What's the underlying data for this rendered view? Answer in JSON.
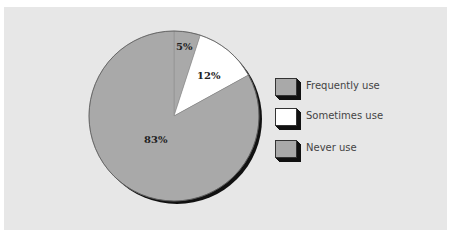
{
  "chart_data": {
    "type": "pie",
    "title": "",
    "slices": [
      {
        "label": "Frequently use",
        "value": 5,
        "display": "5%",
        "color": "#a9a9a9"
      },
      {
        "label": "Sometimes use",
        "value": 12,
        "display": "12%",
        "color": "#ffffff"
      },
      {
        "label": "Never use",
        "value": 83,
        "display": "83%",
        "color": "#a9a9a9"
      }
    ],
    "categories": [
      "Frequently use",
      "Sometimes use",
      "Never use"
    ],
    "values": [
      5,
      12,
      83
    ],
    "unit": "%",
    "legend_position": "right",
    "start_angle": "12 o'clock, clockwise",
    "style": "3D drop shadow"
  },
  "colors": {
    "panel_background": "#e7e7e7",
    "page_background": "#ffffff",
    "slice_gray": "#a9a9a9",
    "slice_white": "#ffffff",
    "shadow": "#111111"
  },
  "legend": {
    "items": [
      {
        "label": "Frequently use",
        "color": "#a9a9a9"
      },
      {
        "label": "Sometimes use",
        "color": "#ffffff"
      },
      {
        "label": "Never use",
        "color": "#a9a9a9"
      }
    ]
  },
  "labels": {
    "slice_0": "5%",
    "slice_1": "12%",
    "slice_2": "83%"
  }
}
